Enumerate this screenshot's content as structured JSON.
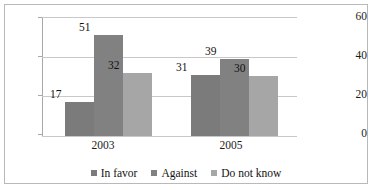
{
  "chart_data": {
    "type": "bar",
    "title": "",
    "subtitle": "",
    "xlabel": "",
    "ylabel": "",
    "categories": [
      "2003",
      "2005"
    ],
    "series": [
      {
        "name": "In favor",
        "values": [
          17,
          31
        ],
        "color": "#7b7b7b"
      },
      {
        "name": "Against",
        "values": [
          51,
          39
        ],
        "color": "#818181"
      },
      {
        "name": "Do not know",
        "values": [
          32,
          30
        ],
        "color": "#a6a6a6"
      }
    ],
    "ylim": [
      0,
      60
    ],
    "yticks": [
      0,
      20,
      40,
      60
    ],
    "ytick_labels": [
      "0",
      "20",
      "40",
      "60"
    ],
    "grid": true,
    "legend_position": "bottom",
    "data_labels": true,
    "annotations": []
  },
  "legend": {
    "items": [
      {
        "label": "In favor"
      },
      {
        "label": "Against"
      },
      {
        "label": "Do not know"
      }
    ]
  }
}
